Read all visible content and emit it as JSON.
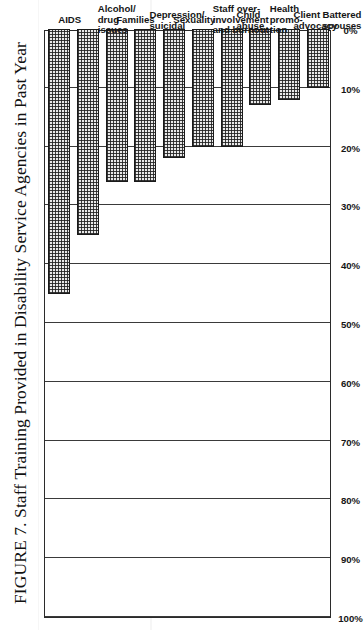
{
  "figure": {
    "title": "FIGURE 7. Staff Training Provided in Disability Service Agencies in Past Year",
    "orientation": "page-rotated-90-ccw"
  },
  "chart_data": {
    "type": "bar",
    "title": "FIGURE 7. Staff Training Provided in Disability Service Agencies in Past Year",
    "xlabel": "",
    "ylabel": "",
    "ylim": [
      0,
      100
    ],
    "grid": true,
    "legend": "none",
    "unit": "%",
    "categories": [
      "AIDS",
      "Alcohol/\ndrug\nissues",
      "Families",
      "Depression/\nsuicidal",
      "Sexuality",
      "Staff over-\ninvolvement\nand burnout",
      "Child\nabuse",
      "Health\npromo-\ntion",
      "Client\nadvocacy",
      "Battered\nspouses"
    ],
    "values": [
      45,
      35,
      26,
      26,
      22,
      20,
      20,
      13,
      12,
      10
    ],
    "tick_labels": [
      "100%",
      "90%",
      "80%",
      "70%",
      "60%",
      "50%",
      "40%",
      "30%",
      "20%",
      "10%",
      "0%"
    ],
    "tick_values": [
      100,
      90,
      80,
      70,
      60,
      50,
      40,
      30,
      20,
      10,
      0
    ]
  },
  "colors": {
    "ink": "#1a1a1a",
    "grid": "#3a3a3a",
    "bar_fill": "#e9e9e9",
    "paper": "#ffffff"
  }
}
